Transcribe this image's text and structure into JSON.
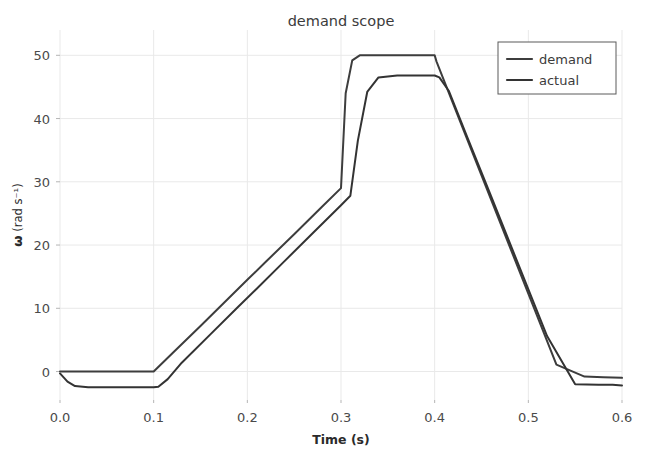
{
  "chart_data": {
    "type": "line",
    "title": "demand scope",
    "xlabel": "Time (s)",
    "ylabel": "ω (rad s⁻¹)",
    "ylabel_parts": {
      "symbol": "ω",
      "units": "(rad s⁻¹)"
    },
    "xlim": [
      0.0,
      0.6
    ],
    "ylim": [
      -4.5,
      54.0
    ],
    "xticks": [
      0.0,
      0.1,
      0.2,
      0.3,
      0.4,
      0.5,
      0.6
    ],
    "xticklabels": [
      "0.0",
      "0.1",
      "0.2",
      "0.3",
      "0.4",
      "0.5",
      "0.6"
    ],
    "yticks": [
      0,
      10,
      20,
      30,
      40,
      50
    ],
    "yticklabels": [
      "0",
      "10",
      "20",
      "30",
      "40",
      "50"
    ],
    "grid": true,
    "grid_color": "#e9e9e9",
    "legend_position": "upper right",
    "series": [
      {
        "name": "demand",
        "color": "#3d3d3d",
        "linewidth": 2.0,
        "x": [
          0.0,
          0.02,
          0.05,
          0.08,
          0.1,
          0.1,
          0.12,
          0.15,
          0.18,
          0.2,
          0.22,
          0.25,
          0.28,
          0.3,
          0.305,
          0.312,
          0.32,
          0.34,
          0.36,
          0.38,
          0.4,
          0.402,
          0.41,
          0.43,
          0.45,
          0.48,
          0.5,
          0.53,
          0.56,
          0.58,
          0.6
        ],
        "y": [
          0.0,
          0.0,
          0.0,
          0.0,
          0.0,
          0.0,
          2.9,
          7.2,
          11.6,
          14.5,
          17.4,
          21.7,
          26.1,
          29.0,
          44.0,
          49.2,
          50.0,
          50.0,
          50.0,
          50.0,
          50.0,
          49.0,
          46.0,
          38.5,
          31.0,
          19.8,
          12.3,
          1.1,
          -0.8,
          -0.9,
          -1.0
        ]
      },
      {
        "name": "actual",
        "color": "#333333",
        "linewidth": 2.0,
        "x": [
          0.0,
          0.008,
          0.016,
          0.03,
          0.06,
          0.09,
          0.1,
          0.105,
          0.115,
          0.13,
          0.16,
          0.19,
          0.21,
          0.24,
          0.27,
          0.3,
          0.31,
          0.318,
          0.328,
          0.34,
          0.36,
          0.38,
          0.4,
          0.405,
          0.415,
          0.435,
          0.46,
          0.49,
          0.52,
          0.55,
          0.575,
          0.59,
          0.6
        ],
        "y": [
          -0.3,
          -1.6,
          -2.3,
          -2.5,
          -2.5,
          -2.5,
          -2.5,
          -2.4,
          -1.2,
          1.4,
          5.8,
          10.2,
          13.1,
          17.5,
          21.9,
          26.3,
          27.8,
          36.5,
          44.2,
          46.5,
          46.8,
          46.8,
          46.8,
          46.5,
          44.4,
          37.0,
          27.8,
          16.7,
          5.6,
          -2.0,
          -2.1,
          -2.1,
          -2.2
        ]
      }
    ]
  },
  "legend": {
    "entries": [
      {
        "label": "demand"
      },
      {
        "label": "actual"
      }
    ]
  }
}
